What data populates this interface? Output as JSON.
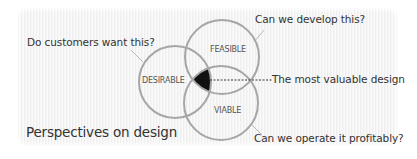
{
  "title": "Perspectives on design",
  "circles": [
    {
      "id": "desirable",
      "label": "DESIRABLE",
      "question": "Do customers want this?"
    },
    {
      "id": "feasible",
      "label": "FEASIBLE",
      "question": "Can we develop this?"
    },
    {
      "id": "viable",
      "label": "VIABLE",
      "question": "Can we operate it profitably?"
    }
  ],
  "intersection": {
    "label": "The most valuable design"
  },
  "colors": {
    "circle_stroke": "#a6a6a6",
    "intersection_fill": "#111111",
    "text": "#333333",
    "background": "#f4f4f4"
  }
}
